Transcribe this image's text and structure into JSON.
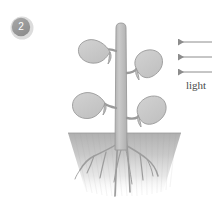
{
  "figure": {
    "caption_number": "2",
    "light_label": "light",
    "arrow_count": 3,
    "arrow_direction": "left",
    "leaf_count": 4,
    "colors": {
      "background": "#ffffff",
      "leaf_fill": "#c9c9c9",
      "leaf_stroke": "#9a9a9a",
      "stem_fill": "#bdbdbd",
      "stem_stroke": "#9a9a9a",
      "soil_top": "#b4b4b4",
      "soil_bottom": "#ffffff",
      "root_stroke": "#9d9d9d",
      "arrow_color": "#8c8c8c",
      "badge_fill": "#9b9b9b",
      "badge_ring": "#d8d8d8",
      "badge_text": "#ffffff",
      "label_text": "#4a4a4a"
    }
  },
  "badge": {
    "label": "2"
  },
  "light": {
    "label": "light",
    "arrows": [
      {
        "y": 42
      },
      {
        "y": 57
      },
      {
        "y": 72
      }
    ]
  },
  "plant": {
    "leaves": [
      {
        "id": "upper-left",
        "position": "upper-left"
      },
      {
        "id": "upper-right",
        "position": "upper-right"
      },
      {
        "id": "lower-left",
        "position": "lower-left"
      },
      {
        "id": "lower-right",
        "position": "lower-right"
      }
    ],
    "stem": {
      "id": "main-stem"
    },
    "roots": {
      "id": "root-system"
    },
    "soil": {
      "id": "soil-block"
    }
  }
}
